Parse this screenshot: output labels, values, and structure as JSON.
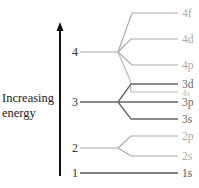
{
  "axis": {
    "label_line1": "Increasing",
    "label_line2": "energy"
  },
  "shells": [
    {
      "n": "1",
      "y": 173,
      "color": "#555555"
    },
    {
      "n": "2",
      "y": 148,
      "color": "#aaaaaa"
    },
    {
      "n": "3",
      "y": 102,
      "color": "#666666"
    },
    {
      "n": "4",
      "y": 52,
      "color": "#aaaaaa"
    }
  ],
  "subshells": [
    {
      "label": "1s",
      "y": 173,
      "color": "#555555",
      "shell": "1"
    },
    {
      "label": "2s",
      "y": 156,
      "color": "#aaaaaa",
      "shell": "2"
    },
    {
      "label": "2p",
      "y": 136,
      "color": "#aaaaaa",
      "shell": "2"
    },
    {
      "label": "3s",
      "y": 119,
      "color": "#666666",
      "shell": "3"
    },
    {
      "label": "3p",
      "y": 102,
      "color": "#666666",
      "shell": "3"
    },
    {
      "label": "4s",
      "y": 92,
      "color": "#bbbbbb",
      "shell": "4"
    },
    {
      "label": "3d",
      "y": 84,
      "color": "#666666",
      "shell": "3"
    },
    {
      "label": "4p",
      "y": 65,
      "color": "#aaaaaa",
      "shell": "4"
    },
    {
      "label": "4d",
      "y": 39,
      "color": "#aaaaaa",
      "shell": "4"
    },
    {
      "label": "4f",
      "y": 13,
      "color": "#aaaaaa",
      "shell": "4"
    }
  ]
}
